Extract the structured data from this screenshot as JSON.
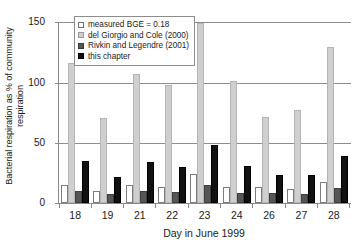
{
  "chart_data": {
    "type": "bar",
    "title": "",
    "xlabel": "Day in June 1999",
    "ylabel": "Bacterial respiration as % of community\nrespiration",
    "categories": [
      "18",
      "19",
      "21",
      "22",
      "23",
      "24",
      "26",
      "27",
      "28"
    ],
    "ylim": [
      0,
      160
    ],
    "yticks": [
      0,
      50,
      100,
      150
    ],
    "ytick_labels": [
      "0",
      "50",
      "100",
      "150"
    ],
    "grid": "horizontal",
    "legend_position": "top-left-inside",
    "series": [
      {
        "name": "measured BGE = 0.18",
        "color": "#ffffff",
        "values": [
          16,
          11,
          16,
          14,
          26,
          14,
          14,
          12,
          19
        ]
      },
      {
        "name": "del Giorgio and Cole (2000)",
        "color": "#cfcfcf",
        "values": [
          124,
          75,
          114,
          104,
          159,
          108,
          76,
          82,
          138
        ]
      },
      {
        "name": "Rivkin and Legendre (2001)",
        "color": "#555555",
        "values": [
          11,
          8,
          11,
          10,
          16,
          9,
          9,
          8,
          13
        ]
      },
      {
        "name": "this chapter",
        "color": "#111111",
        "values": [
          37,
          23,
          36,
          32,
          51,
          33,
          25,
          25,
          42
        ]
      }
    ]
  },
  "legend": {
    "items": [
      {
        "label": "measured BGE = 0.18",
        "swatch": "measured"
      },
      {
        "label": "del Giorgio and Cole (2000)",
        "swatch": "delgiorgio"
      },
      {
        "label": "Rivkin and Legendre (2001)",
        "swatch": "rivkin"
      },
      {
        "label": "this chapter",
        "swatch": "chapter"
      }
    ]
  }
}
